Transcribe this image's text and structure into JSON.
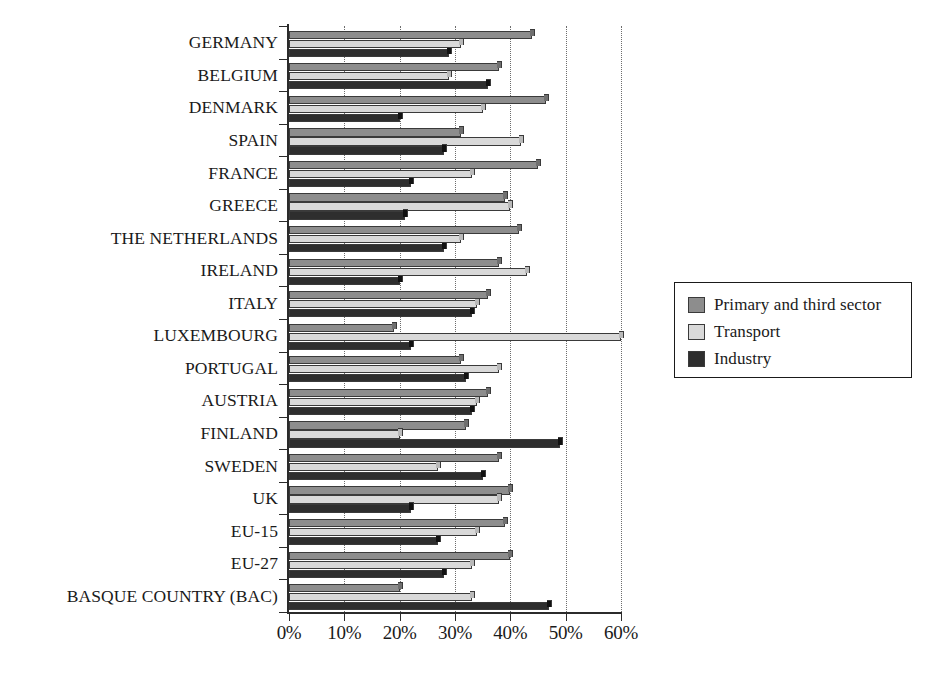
{
  "chart_data": {
    "type": "bar",
    "orientation": "horizontal",
    "title": "",
    "xlabel": "",
    "ylabel": "",
    "xlim": [
      0,
      60
    ],
    "xtick_labels": [
      "0%",
      "10%",
      "20%",
      "30%",
      "40%",
      "50%",
      "60%"
    ],
    "xticks": [
      0,
      10,
      20,
      30,
      40,
      50,
      60
    ],
    "grid": "vertical dotted gridlines at each 10% tick",
    "legend_position": "right",
    "categories": [
      "GERMANY",
      "BELGIUM",
      "DENMARK",
      "SPAIN",
      "FRANCE",
      "GREECE",
      "THE NETHERLANDS",
      "IRELAND",
      "ITALY",
      "LUXEMBOURG",
      "PORTUGAL",
      "AUSTRIA",
      "FINLAND",
      "SWEDEN",
      "UK",
      "EU-15",
      "EU-27",
      "BASQUE COUNTRY (BAC)"
    ],
    "series": [
      {
        "name": "Primary and third sector",
        "color": "#8d8d8d",
        "values": [
          44,
          38,
          46.5,
          31,
          45,
          39,
          41.5,
          38,
          36,
          19,
          31,
          36,
          32,
          38,
          40,
          39,
          40,
          20
        ]
      },
      {
        "name": "Transport",
        "color": "#d9d9d9",
        "values": [
          31,
          29,
          35,
          42,
          33,
          40,
          31,
          43,
          34,
          60,
          38,
          34,
          20,
          27,
          38,
          34,
          33,
          33
        ]
      },
      {
        "name": "Industry",
        "color": "#2e2e2e",
        "values": [
          29,
          36,
          20,
          28,
          22,
          21,
          28,
          20,
          33,
          22,
          32,
          33,
          49,
          35,
          22,
          27,
          28,
          47
        ]
      }
    ]
  },
  "legend": {
    "items": [
      {
        "label": "Primary and third sector",
        "color": "#8d8d8d"
      },
      {
        "label": "Transport",
        "color": "#d9d9d9"
      },
      {
        "label": "Industry",
        "color": "#2e2e2e"
      }
    ]
  }
}
